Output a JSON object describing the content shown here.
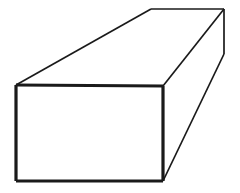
{
  "figure": {
    "name": "rectangular-prism-diagram",
    "canvas": {
      "width": 240,
      "height": 193,
      "background_color": "#ffffff"
    },
    "style": {
      "stroke_color": "#1a1a1a",
      "fill_color": "#ffffff",
      "front_face_stroke_width": 3.2,
      "receding_edge_stroke_width": 1.7,
      "top_face_stroke_width": 1.7,
      "line_cap": "butt",
      "line_join": "miter"
    },
    "vertices": {
      "front_top_left": [
        16,
        85
      ],
      "front_top_right": [
        163,
        86
      ],
      "front_bottom_right": [
        163,
        181
      ],
      "front_bottom_left": [
        16,
        181
      ],
      "back_top_left": [
        151,
        9
      ],
      "back_top_right": [
        224,
        9
      ],
      "back_bottom_right": [
        224,
        54
      ]
    },
    "faces": [
      {
        "name": "front-face",
        "label": "Front rectangular face",
        "points": "16,85 163,86 163,181 16,181",
        "emphasis": "heavy"
      },
      {
        "name": "top-face",
        "label": "Top face receding to upper right",
        "points": "16,85 151,9 224,9 163,86",
        "emphasis": "light"
      },
      {
        "name": "right-side-face",
        "label": "Right side face receding to upper right",
        "points": "163,86 224,9 224,54 163,181",
        "emphasis": "light"
      }
    ],
    "edges": [
      {
        "name": "front-top-edge",
        "from": [
          16,
          85
        ],
        "to": [
          163,
          86
        ],
        "weight": "heavy"
      },
      {
        "name": "front-right-edge",
        "from": [
          163,
          86
        ],
        "to": [
          163,
          181
        ],
        "weight": "heavy"
      },
      {
        "name": "front-bottom-edge",
        "from": [
          163,
          181
        ],
        "to": [
          16,
          181
        ],
        "weight": "heavy"
      },
      {
        "name": "front-left-edge",
        "from": [
          16,
          181
        ],
        "to": [
          16,
          85
        ],
        "weight": "heavy"
      },
      {
        "name": "top-left-receding-edge",
        "from": [
          16,
          85
        ],
        "to": [
          151,
          9
        ],
        "weight": "light"
      },
      {
        "name": "back-top-edge",
        "from": [
          151,
          9
        ],
        "to": [
          224,
          9
        ],
        "weight": "light"
      },
      {
        "name": "top-right-receding-edge",
        "from": [
          163,
          86
        ],
        "to": [
          224,
          9
        ],
        "weight": "light"
      },
      {
        "name": "back-right-vertical-edge",
        "from": [
          224,
          9
        ],
        "to": [
          224,
          54
        ],
        "weight": "light"
      },
      {
        "name": "bottom-right-receding-edge",
        "from": [
          224,
          54
        ],
        "to": [
          163,
          181
        ],
        "weight": "light"
      }
    ]
  }
}
